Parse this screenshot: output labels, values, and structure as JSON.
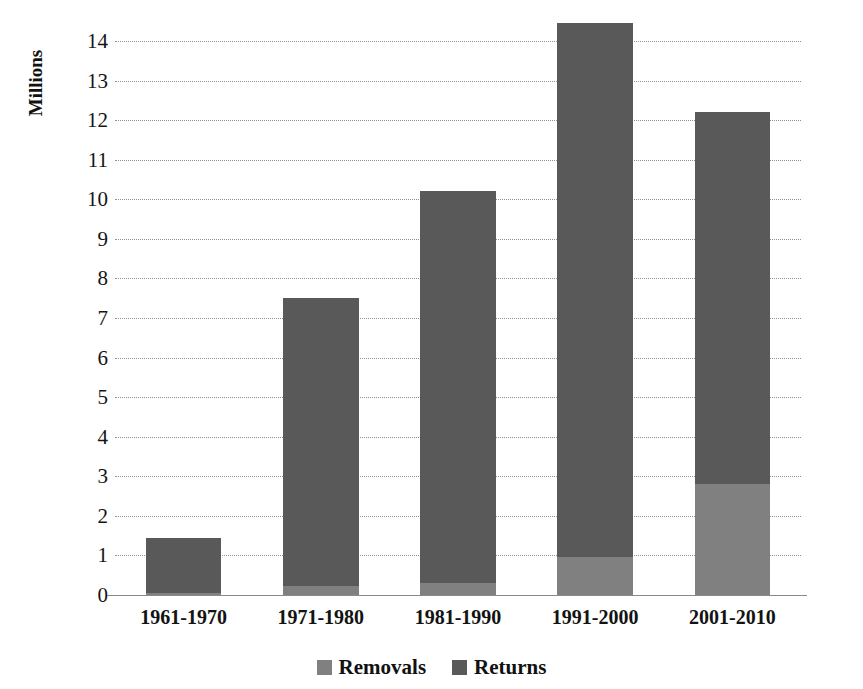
{
  "chart_data": {
    "type": "bar",
    "subtype": "stacked-column",
    "title": "",
    "xlabel": "",
    "ylabel": "Millions",
    "ylim": [
      0,
      14
    ],
    "ytick_step": 1,
    "yticks": [
      14,
      13,
      12,
      11,
      10,
      9,
      8,
      7,
      6,
      5,
      4,
      3,
      2,
      1,
      0
    ],
    "ytick_labels": [
      "14",
      "13",
      "12",
      "11",
      "10",
      "9",
      "8",
      "7",
      "6",
      "5",
      "4",
      "3",
      "2",
      "1",
      "0"
    ],
    "grid": true,
    "grid_axis": "y",
    "legend_position": "bottom",
    "categories": [
      "1961-1970",
      "1971-1980",
      "1981-1990",
      "1991-2000",
      "2001-2010"
    ],
    "series": [
      {
        "name": "Removals",
        "color": "#808080",
        "values": [
          0.05,
          0.24,
          0.3,
          0.95,
          2.8
        ]
      },
      {
        "name": "Returns",
        "color": "#595959",
        "values": [
          1.4,
          7.26,
          9.9,
          13.5,
          9.4
        ]
      }
    ],
    "totals": [
      1.45,
      7.5,
      10.2,
      14.45,
      12.2
    ]
  },
  "axis": {
    "y_caption": "Millions"
  },
  "legend": {
    "items": [
      {
        "label": "Removals",
        "color": "#808080"
      },
      {
        "label": "Returns",
        "color": "#595959"
      }
    ]
  },
  "colors": {
    "removals": "#808080",
    "returns": "#595959",
    "gridline": "#8e8e8e",
    "axis": "#8a8a8a",
    "text": "#151515",
    "background": "#ffffff"
  }
}
